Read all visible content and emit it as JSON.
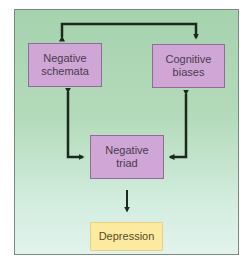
{
  "diagram": {
    "title": "",
    "colors": {
      "panel_background": "#b4dbbb",
      "node_purple": "#cfa6d6",
      "node_yellow": "#fbeaa0",
      "arrow": "#1c2a1c"
    },
    "nodes": [
      {
        "id": "negative-schemata",
        "label_line1": "Negative",
        "label_line2": "schemata"
      },
      {
        "id": "cognitive-biases",
        "label_line1": "Cognitive",
        "label_line2": "biases"
      },
      {
        "id": "negative-triad",
        "label_line1": "Negative",
        "label_line2": "triad"
      },
      {
        "id": "depression",
        "label": "Depression"
      }
    ],
    "edges": [
      {
        "from": "negative-schemata",
        "to": "cognitive-biases",
        "type": "bidirectional"
      },
      {
        "from": "negative-schemata",
        "to": "negative-triad",
        "type": "bidirectional"
      },
      {
        "from": "cognitive-biases",
        "to": "negative-triad",
        "type": "bidirectional"
      },
      {
        "from": "negative-triad",
        "to": "depression",
        "type": "directed"
      }
    ]
  }
}
